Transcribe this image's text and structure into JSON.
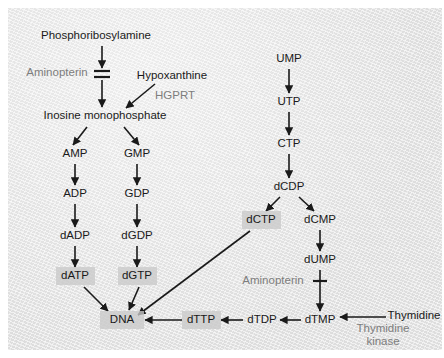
{
  "figure": {
    "background_color": "#e8e8e8",
    "text_color": "#1a1a1a",
    "enzyme_text_color": "#7d7d7d",
    "highlight_box_color": "#c9c9c9"
  },
  "nodes": [
    {
      "id": "phosphoribosylamine",
      "label": "Phosphoribosylamine",
      "x": 88,
      "y": 28,
      "highlighted": false,
      "kind": "metabolite"
    },
    {
      "id": "inosine_monophosphate",
      "label": "Inosine monophosphate",
      "x": 97,
      "y": 108,
      "highlighted": false,
      "kind": "metabolite"
    },
    {
      "id": "hypoxanthine",
      "label": "Hypoxanthine",
      "x": 164,
      "y": 68,
      "highlighted": false,
      "kind": "metabolite"
    },
    {
      "id": "amp",
      "label": "AMP",
      "x": 67,
      "y": 146,
      "highlighted": false,
      "kind": "metabolite"
    },
    {
      "id": "gmp",
      "label": "GMP",
      "x": 129,
      "y": 146,
      "highlighted": false,
      "kind": "metabolite"
    },
    {
      "id": "adp",
      "label": "ADP",
      "x": 67,
      "y": 186,
      "highlighted": false,
      "kind": "metabolite"
    },
    {
      "id": "gdp",
      "label": "GDP",
      "x": 129,
      "y": 186,
      "highlighted": false,
      "kind": "metabolite"
    },
    {
      "id": "dadp",
      "label": "dADP",
      "x": 67,
      "y": 228,
      "highlighted": false,
      "kind": "metabolite"
    },
    {
      "id": "dgdp",
      "label": "dGDP",
      "x": 129,
      "y": 228,
      "highlighted": false,
      "kind": "metabolite"
    },
    {
      "id": "datp",
      "label": "dATP",
      "x": 67,
      "y": 268,
      "highlighted": true,
      "kind": "metabolite"
    },
    {
      "id": "dgtp",
      "label": "dGTP",
      "x": 129,
      "y": 268,
      "highlighted": true,
      "kind": "metabolite"
    },
    {
      "id": "dna",
      "label": "DNA",
      "x": 114,
      "y": 312,
      "highlighted": true,
      "kind": "product"
    },
    {
      "id": "ump",
      "label": "UMP",
      "x": 281,
      "y": 51,
      "highlighted": false,
      "kind": "metabolite"
    },
    {
      "id": "utp",
      "label": "UTP",
      "x": 281,
      "y": 94,
      "highlighted": false,
      "kind": "metabolite"
    },
    {
      "id": "ctp",
      "label": "CTP",
      "x": 281,
      "y": 136,
      "highlighted": false,
      "kind": "metabolite"
    },
    {
      "id": "dcdp",
      "label": "dCDP",
      "x": 281,
      "y": 179,
      "highlighted": false,
      "kind": "metabolite"
    },
    {
      "id": "dctp",
      "label": "dCTP",
      "x": 253,
      "y": 212,
      "highlighted": true,
      "kind": "metabolite"
    },
    {
      "id": "dcmp",
      "label": "dCMP",
      "x": 312,
      "y": 212,
      "highlighted": false,
      "kind": "metabolite"
    },
    {
      "id": "dump",
      "label": "dUMP",
      "x": 312,
      "y": 252,
      "highlighted": false,
      "kind": "metabolite"
    },
    {
      "id": "dtmp",
      "label": "dTMP",
      "x": 312,
      "y": 312,
      "highlighted": false,
      "kind": "metabolite"
    },
    {
      "id": "dtdp",
      "label": "dTDP",
      "x": 254,
      "y": 312,
      "highlighted": false,
      "kind": "metabolite"
    },
    {
      "id": "dttp",
      "label": "dTTP",
      "x": 193,
      "y": 312,
      "highlighted": true,
      "kind": "metabolite"
    },
    {
      "id": "thymidine",
      "label": "Thymidine",
      "x": 406,
      "y": 308,
      "highlighted": false,
      "kind": "metabolite"
    }
  ],
  "enzyme_labels": [
    {
      "id": "aminopterin_1",
      "label": "Aminopterin",
      "x": 49,
      "y": 65
    },
    {
      "id": "hgprt",
      "label": "HGPRT",
      "x": 167,
      "y": 88
    },
    {
      "id": "aminopterin_2",
      "label": "Aminopterin",
      "x": 265,
      "y": 273
    },
    {
      "id": "thymidine_kinase_line1",
      "label": "Thymidine",
      "x": 375,
      "y": 321
    },
    {
      "id": "thymidine_kinase_line2",
      "label": "kinase",
      "x": 375,
      "y": 334
    }
  ],
  "edges": [
    {
      "id": "pra-to-block",
      "from": "phosphoribosylamine",
      "to": "aminopterin-block",
      "type": "arrow"
    },
    {
      "id": "block-to-imp",
      "from": "aminopterin-block",
      "to": "inosine_monophosphate",
      "type": "arrow"
    },
    {
      "id": "hypo-to-imp",
      "from": "hypoxanthine",
      "to": "inosine_monophosphate",
      "type": "arrow"
    },
    {
      "id": "imp-to-amp",
      "from": "inosine_monophosphate",
      "to": "amp",
      "type": "arrow"
    },
    {
      "id": "imp-to-gmp",
      "from": "inosine_monophosphate",
      "to": "gmp",
      "type": "arrow"
    },
    {
      "id": "amp-to-adp",
      "from": "amp",
      "to": "adp",
      "type": "arrow"
    },
    {
      "id": "gmp-to-gdp",
      "from": "gmp",
      "to": "gdp",
      "type": "arrow"
    },
    {
      "id": "adp-to-dadp",
      "from": "adp",
      "to": "dadp",
      "type": "arrow"
    },
    {
      "id": "gdp-to-dgdp",
      "from": "gdp",
      "to": "dgdp",
      "type": "arrow"
    },
    {
      "id": "dadp-to-datp",
      "from": "dadp",
      "to": "datp",
      "type": "arrow"
    },
    {
      "id": "dgdp-to-dgtp",
      "from": "dgdp",
      "to": "dgtp",
      "type": "arrow"
    },
    {
      "id": "datp-to-dna",
      "from": "datp",
      "to": "dna",
      "type": "arrow"
    },
    {
      "id": "dgtp-to-dna",
      "from": "dgtp",
      "to": "dna",
      "type": "arrow"
    },
    {
      "id": "dctp-to-dna",
      "from": "dctp",
      "to": "dna",
      "type": "arrow"
    },
    {
      "id": "dttp-to-dna",
      "from": "dttp",
      "to": "dna",
      "type": "arrow"
    },
    {
      "id": "ump-to-utp",
      "from": "ump",
      "to": "utp",
      "type": "arrow"
    },
    {
      "id": "utp-to-ctp",
      "from": "utp",
      "to": "ctp",
      "type": "arrow"
    },
    {
      "id": "ctp-to-dcdp",
      "from": "ctp",
      "to": "dcdp",
      "type": "arrow"
    },
    {
      "id": "dcdp-to-dctp",
      "from": "dcdp",
      "to": "dctp",
      "type": "arrow"
    },
    {
      "id": "dcdp-to-dcmp",
      "from": "dcdp",
      "to": "dcmp",
      "type": "arrow"
    },
    {
      "id": "dcmp-to-dump",
      "from": "dcmp",
      "to": "dump",
      "type": "arrow"
    },
    {
      "id": "dump-to-dtmp",
      "from": "dump",
      "to": "dtmp",
      "type": "arrow",
      "inhibited_by": "aminopterin_2"
    },
    {
      "id": "thymidine-to-dtmp",
      "from": "thymidine",
      "to": "dtmp",
      "type": "arrow",
      "enzyme": "thymidine_kinase_line1"
    },
    {
      "id": "dtmp-to-dtdp",
      "from": "dtmp",
      "to": "dtdp",
      "type": "arrow"
    },
    {
      "id": "dtdp-to-dttp",
      "from": "dtdp",
      "to": "dttp",
      "type": "arrow"
    }
  ],
  "inhibitions": [
    {
      "id": "aminopterin-block-1",
      "label_ref": "aminopterin_1",
      "style": "double-bar",
      "x": 94,
      "y": 66
    },
    {
      "id": "aminopterin-block-2",
      "label_ref": "aminopterin_2",
      "style": "single-bar",
      "x": 312,
      "y": 273
    }
  ]
}
